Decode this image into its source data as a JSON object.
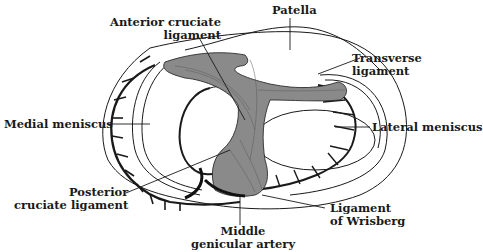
{
  "diagram": {
    "labels": {
      "patella": "Patella",
      "acl_line1": "Anterior cruciate",
      "acl_line2": "ligament",
      "transverse_line1": "Transverse",
      "transverse_line2": "ligament",
      "medial_meniscus": "Medial meniscus",
      "lateral_meniscus": "Lateral meniscus",
      "pcl_line1": "Posterior",
      "pcl_line2": "cruciate ligament",
      "wrisberg_line1": "Ligament",
      "wrisberg_line2": "of Wrisberg",
      "artery_line1": "Middle",
      "artery_line2": "genicular artery"
    },
    "colors": {
      "ink": "#1a1a1a",
      "ligament_fill": "#8a8a8a",
      "background": "#ffffff"
    }
  }
}
